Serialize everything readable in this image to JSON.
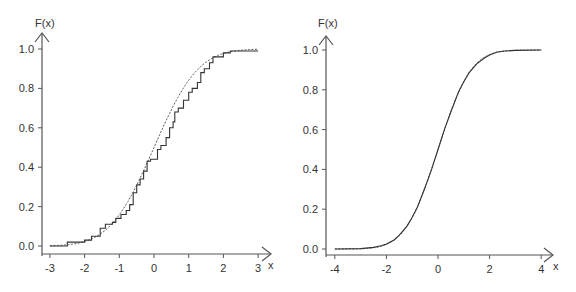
{
  "chart_data": [
    {
      "type": "line",
      "title": "",
      "xlabel": "x",
      "ylabel": "F(x)",
      "xlim": [
        -3,
        3
      ],
      "ylim": [
        0,
        1
      ],
      "xticks": [
        "-3",
        "-2",
        "-1",
        "0",
        "1",
        "2",
        "3"
      ],
      "yticks": [
        "0.0",
        "0.2",
        "0.4",
        "0.6",
        "0.8",
        "1.0"
      ],
      "grid": false,
      "legend": null,
      "series": [
        {
          "name": "empirical CDF",
          "style": "solid-step",
          "x": [
            -3,
            -2.6,
            -2.5,
            -2.1,
            -2.0,
            -1.8,
            -1.6,
            -1.55,
            -1.4,
            -1.2,
            -1.1,
            -0.95,
            -0.8,
            -0.7,
            -0.6,
            -0.5,
            -0.4,
            -0.3,
            -0.2,
            -0.1,
            0.0,
            0.1,
            0.2,
            0.35,
            0.45,
            0.55,
            0.6,
            0.7,
            0.85,
            1.0,
            1.1,
            1.25,
            1.35,
            1.45,
            1.6,
            1.7,
            1.9,
            2.0,
            2.2,
            3.0
          ],
          "y": [
            0,
            0,
            0.02,
            0.02,
            0.03,
            0.05,
            0.05,
            0.09,
            0.11,
            0.12,
            0.14,
            0.16,
            0.18,
            0.21,
            0.27,
            0.31,
            0.34,
            0.38,
            0.43,
            0.44,
            0.44,
            0.49,
            0.51,
            0.55,
            0.6,
            0.63,
            0.68,
            0.7,
            0.74,
            0.78,
            0.8,
            0.83,
            0.88,
            0.9,
            0.93,
            0.96,
            0.96,
            0.98,
            0.99,
            0.99
          ]
        },
        {
          "name": "standard normal CDF",
          "style": "dotted",
          "function": "Phi(x)",
          "x_range": [
            -3,
            3
          ]
        }
      ]
    },
    {
      "type": "line",
      "title": "",
      "xlabel": "x",
      "ylabel": "F(x)",
      "xlim": [
        -4,
        4
      ],
      "ylim": [
        0,
        1
      ],
      "xticks": [
        "-4",
        "-2",
        "0",
        "2",
        "4"
      ],
      "yticks": [
        "0.0",
        "0.2",
        "0.4",
        "0.6",
        "0.8",
        "1.0"
      ],
      "grid": false,
      "legend": null,
      "series": [
        {
          "name": "empirical CDF (large sample)",
          "style": "solid",
          "x": [
            -4,
            -3,
            -2.5,
            -2.2,
            -2.0,
            -1.7,
            -1.5,
            -1.2,
            -1.0,
            -0.8,
            -0.5,
            -0.25,
            0.0,
            0.25,
            0.5,
            0.8,
            1.0,
            1.2,
            1.5,
            1.8,
            2.0,
            2.3,
            2.6,
            3.0,
            4.0
          ],
          "y": [
            0,
            0.002,
            0.008,
            0.016,
            0.025,
            0.045,
            0.07,
            0.115,
            0.16,
            0.21,
            0.31,
            0.4,
            0.5,
            0.6,
            0.69,
            0.79,
            0.84,
            0.885,
            0.93,
            0.96,
            0.975,
            0.99,
            0.995,
            0.998,
            1.0
          ]
        },
        {
          "name": "standard normal CDF",
          "style": "dotted",
          "function": "Phi(x)",
          "x_range": [
            -4,
            4
          ]
        }
      ]
    }
  ],
  "left_chart": {
    "ylabel": "F(x)",
    "xlabel": "x",
    "xticks": [
      "-3",
      "-2",
      "-1",
      "0",
      "1",
      "2",
      "3"
    ],
    "yticks": [
      "0.0",
      "0.2",
      "0.4",
      "0.6",
      "0.8",
      "1.0"
    ]
  },
  "right_chart": {
    "ylabel": "F(x)",
    "xlabel": "x",
    "xticks": [
      "-4",
      "-2",
      "0",
      "2",
      "4"
    ],
    "yticks": [
      "0.0",
      "0.2",
      "0.4",
      "0.6",
      "0.8",
      "1.0"
    ]
  }
}
